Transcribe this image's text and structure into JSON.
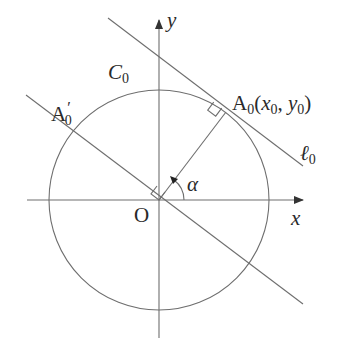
{
  "diagram": {
    "type": "geometry",
    "colors": {
      "background": "#ffffff",
      "stroke": "#6e6e6e",
      "text": "#2a2a2a"
    },
    "labels": {
      "y_axis": "y",
      "x_axis": "x",
      "origin": "O",
      "circle": "C",
      "circle_sub": "0",
      "point_A0_main": "A",
      "point_A0_sub": "0",
      "point_A0_open": "(",
      "point_A0_x": "x",
      "point_A0_x_sub": "0",
      "point_A0_comma": ", ",
      "point_A0_y": "y",
      "point_A0_y_sub": "0",
      "point_A0_close": ")",
      "point_A0p_main": "A",
      "point_A0p_prime": "′",
      "point_A0p_sub": "0",
      "tangent_line": "ℓ",
      "tangent_line_sub": "0",
      "angle": "α"
    },
    "geometry": {
      "origin_px": [
        159,
        200
      ],
      "radius_px": 110,
      "x_axis_px": [
        [
          27,
          200
        ],
        [
          303,
          200
        ]
      ],
      "y_axis_px": [
        [
          159,
          338
        ],
        [
          159,
          20
        ]
      ],
      "tangent_line_px": [
        [
          108,
          18
        ],
        [
          303,
          166
        ]
      ],
      "radius_segment_px": [
        [
          159,
          200
        ],
        [
          226,
          112
        ]
      ],
      "perpendicular_line_px": [
        [
          26,
          95
        ],
        [
          303,
          304
        ]
      ],
      "right_angle_markers": [
        "at A0 between radius and tangent",
        "at O between radius and perpendicular line"
      ],
      "angle_arc": "alpha measured from positive x-axis to OA0"
    }
  }
}
